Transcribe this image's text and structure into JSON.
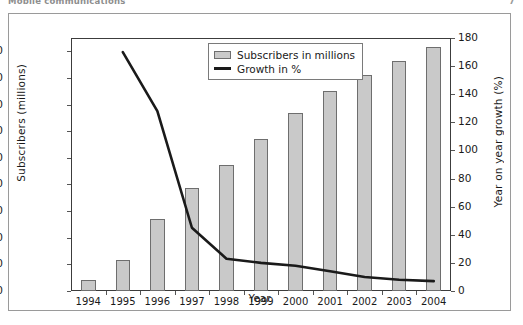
{
  "header": {
    "running_title": "Mobile communications",
    "page_number": "7"
  },
  "figure": {
    "legend_position": "top-center",
    "colors": {
      "bar_fill": "#c9c9c9",
      "bar_border": "#6e6e6e",
      "line": "#1a1a1a",
      "axis": "#3c3c3c",
      "frame": "#9a9a9a"
    }
  },
  "chart_data": {
    "type": "bar",
    "title": "",
    "xlabel": "Year",
    "ylabel": "Subscribers (millions)",
    "y2label": "Year on year growth (%)",
    "grid": false,
    "legend_position": "top-center",
    "categories": [
      "1994",
      "1995",
      "1996",
      "1997",
      "1998",
      "1999",
      "2000",
      "2001",
      "2002",
      "2003",
      "2004"
    ],
    "ylim": [
      0,
      95
    ],
    "y2lim": [
      0,
      180
    ],
    "yticks": [
      0,
      10,
      20,
      30,
      40,
      50,
      60,
      70,
      80,
      90
    ],
    "y2ticks": [
      0,
      20,
      40,
      60,
      80,
      100,
      120,
      140,
      160,
      180
    ],
    "series": [
      {
        "name": "Subscribers in millions",
        "type": "bar",
        "axis": "left",
        "values": [
          4.3,
          11.8,
          27.0,
          38.5,
          47.5,
          57.0,
          67.0,
          75.0,
          81.0,
          86.5,
          91.5
        ]
      },
      {
        "name": "Growth in %",
        "type": "line",
        "axis": "right",
        "x": [
          "1995",
          "1996",
          "1997",
          "1998",
          "1999",
          "2000",
          "2001",
          "2002",
          "2003",
          "2004"
        ],
        "values": [
          170,
          128,
          45,
          23,
          20,
          18,
          14,
          10,
          8,
          7
        ]
      }
    ]
  }
}
